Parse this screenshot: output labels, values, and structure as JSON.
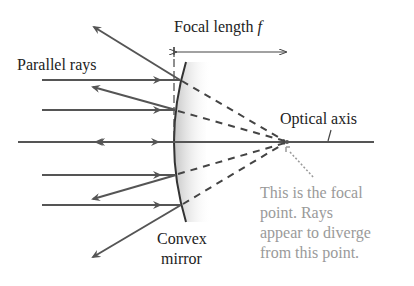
{
  "figure": {
    "labels": {
      "focal_length": "Focal length ",
      "focal_symbol": "f",
      "parallel_rays": "Parallel rays",
      "optical_axis": "Optical axis",
      "mirror_line1": "Convex",
      "mirror_line2": "mirror",
      "note_line1": "This is the focal",
      "note_line2": "point. Rays",
      "note_line3": "appear to diverge",
      "note_line4": "from this point."
    },
    "colors": {
      "ray": "#555555",
      "text": "#222222",
      "note_text": "#9a9a9a",
      "mirror_shade": "#cfcfcf"
    },
    "elements": {
      "mirror_type": "convex",
      "incoming_parallel_rays": 5,
      "reflected_rays": 4
    }
  }
}
